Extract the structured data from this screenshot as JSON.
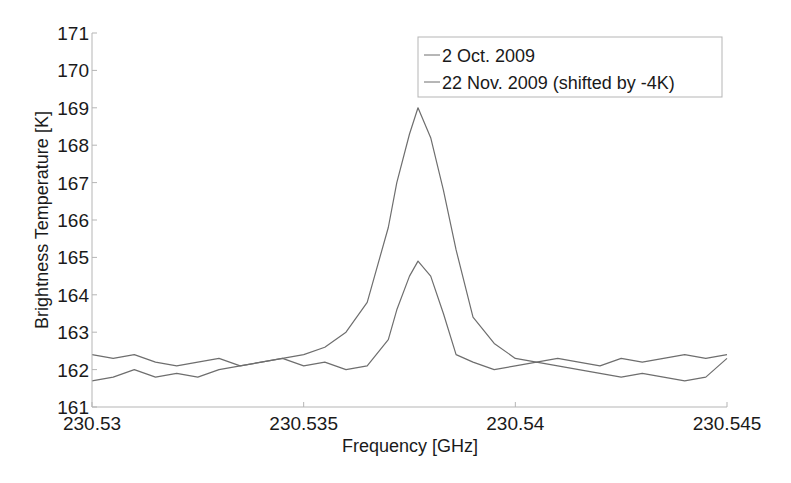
{
  "chart_data": {
    "type": "line",
    "title": "",
    "xlabel": "Frequency [GHz]",
    "ylabel": "Brightness Temperature [K]",
    "xlim": [
      230.53,
      230.545
    ],
    "ylim": [
      161,
      171
    ],
    "xticks": [
      230.53,
      230.535,
      230.54,
      230.545
    ],
    "xtick_labels": [
      "230.53",
      "230.535",
      "230.54",
      "230.545"
    ],
    "yticks": [
      161,
      162,
      163,
      164,
      165,
      166,
      167,
      168,
      169,
      170,
      171
    ],
    "ytick_labels": [
      "161",
      "162",
      "163",
      "164",
      "165",
      "166",
      "167",
      "168",
      "169",
      "170",
      "171"
    ],
    "grid": false,
    "legend_position": "upper right",
    "line_color": "#6e6e6e",
    "series": [
      {
        "name": "2 Oct. 2009",
        "x": [
          230.53,
          230.5305,
          230.531,
          230.5315,
          230.532,
          230.5325,
          230.533,
          230.5335,
          230.534,
          230.5345,
          230.535,
          230.5355,
          230.536,
          230.5365,
          230.537,
          230.5372,
          230.5375,
          230.5377,
          230.538,
          230.5383,
          230.5386,
          230.539,
          230.5395,
          230.54,
          230.5405,
          230.541,
          230.5415,
          230.542,
          230.5425,
          230.543,
          230.5435,
          230.544,
          230.5445,
          230.545
        ],
        "values": [
          162.4,
          162.3,
          162.4,
          162.2,
          162.1,
          162.2,
          162.3,
          162.1,
          162.2,
          162.3,
          162.1,
          162.2,
          162.0,
          162.1,
          162.8,
          163.6,
          164.5,
          164.9,
          164.5,
          163.5,
          162.4,
          162.2,
          162.0,
          162.1,
          162.2,
          162.1,
          162.0,
          161.9,
          161.8,
          161.9,
          161.8,
          161.7,
          161.8,
          162.3
        ]
      },
      {
        "name": "22 Nov. 2009 (shifted by -4K)",
        "x": [
          230.53,
          230.5305,
          230.531,
          230.5315,
          230.532,
          230.5325,
          230.533,
          230.5335,
          230.534,
          230.5345,
          230.535,
          230.5355,
          230.536,
          230.5365,
          230.537,
          230.5372,
          230.5375,
          230.5377,
          230.538,
          230.5383,
          230.5386,
          230.539,
          230.5395,
          230.54,
          230.5405,
          230.541,
          230.5415,
          230.542,
          230.5425,
          230.543,
          230.5435,
          230.544,
          230.5445,
          230.545
        ],
        "values": [
          161.7,
          161.8,
          162.0,
          161.8,
          161.9,
          161.8,
          162.0,
          162.1,
          162.2,
          162.3,
          162.4,
          162.6,
          163.0,
          163.8,
          165.8,
          167.0,
          168.3,
          169.0,
          168.2,
          166.8,
          165.2,
          163.4,
          162.7,
          162.3,
          162.2,
          162.3,
          162.2,
          162.1,
          162.3,
          162.2,
          162.3,
          162.4,
          162.3,
          162.4
        ]
      }
    ]
  }
}
